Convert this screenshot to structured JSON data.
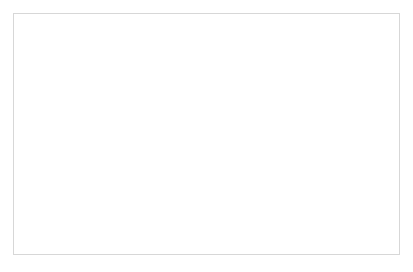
{
  "figure": {
    "background_color": "#ffffff",
    "border_color": "#d7d7d7"
  },
  "chart_data": {
    "type": "line",
    "title": "",
    "subtitle": "",
    "xlabel": "",
    "ylabel": "",
    "grid": true,
    "grid_axis": "y",
    "legend_position": "inside-upper-left",
    "x": [
      2000,
      2001,
      2002,
      2003,
      2004,
      2005,
      2006,
      2007,
      2008,
      2009,
      2010,
      2011,
      2012,
      2013
    ],
    "categories": [
      "2000",
      "2001",
      "2002",
      "2003",
      "2004",
      "2005",
      "2006",
      "2007",
      "2008",
      "2009",
      "2010",
      "2011",
      "2012",
      ""
    ],
    "xtick_labels": [
      "2000",
      "2001",
      "2002",
      "2003",
      "2004",
      "2005",
      "2006",
      "2007",
      "2008",
      "2009",
      "2010",
      "2011",
      "2012"
    ],
    "ytick_labels": [
      "0",
      "2000",
      "4000",
      "6000",
      "8000",
      "10000",
      "12000"
    ],
    "yticks": [
      0,
      2000,
      4000,
      6000,
      8000,
      10000,
      12000
    ],
    "ylim": [
      0,
      12000
    ],
    "xlim": [
      2000,
      2013
    ],
    "series": [
      {
        "name": "Romanian self-employed",
        "marker": "diamond",
        "color": "#4a4a4a",
        "values": [
          130,
          150,
          180,
          230,
          330,
          560,
          850,
          1650,
          3450,
          5250,
          6600,
          8050,
          10100,
          10550
        ]
      },
      {
        "name": "Polish self-employed",
        "marker": "square",
        "color": "#b3b3b3",
        "values": [
          330,
          430,
          560,
          900,
          1450,
          2100,
          3150,
          4200,
          4800,
          4900,
          4850,
          4850,
          4950,
          4750
        ]
      },
      {
        "name": "Bulgarian self-employed",
        "marker": "triangle",
        "color": "#6e6e6e",
        "values": [
          60,
          70,
          110,
          170,
          150,
          160,
          170,
          460,
          760,
          980,
          1300,
          1600,
          2150,
          2300
        ]
      },
      {
        "name": "Romanian Permit B",
        "marker": "x",
        "color": "#3d3d3d",
        "values": [
          40,
          45,
          50,
          60,
          70,
          80,
          90,
          210,
          480,
          700,
          1000,
          1300,
          1800,
          2000
        ]
      },
      {
        "name": "Bulgarian permit B",
        "marker": "dash",
        "color": "#9d9d9d",
        "values": [
          60,
          62,
          70,
          80,
          90,
          95,
          100,
          150,
          210,
          250,
          290,
          330,
          370,
          390
        ]
      }
    ]
  }
}
